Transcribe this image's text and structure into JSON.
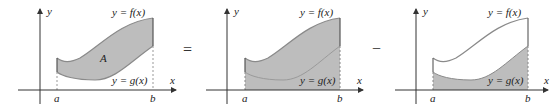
{
  "diagram": {
    "colors": {
      "region_fill": "#bdbdbd",
      "curve_stroke": "#8a8a8a",
      "axis": "#333333",
      "dashed": "#999999"
    },
    "operators": {
      "equals": "=",
      "minus": "−"
    },
    "panels": [
      {
        "name": "region-between-curves",
        "y_axis_label": "y",
        "x_axis_label": "x",
        "f_label": "y = f(x)",
        "g_label": "y = g(x)",
        "area_label": "A",
        "a_label": "a",
        "b_label": "b"
      },
      {
        "name": "area-under-f",
        "y_axis_label": "y",
        "x_axis_label": "x",
        "f_label": "y = f(x)",
        "g_label": "y = g(x)",
        "a_label": "a",
        "b_label": "b"
      },
      {
        "name": "area-under-g",
        "y_axis_label": "y",
        "x_axis_label": "x",
        "f_label": "y = f(x)",
        "g_label": "y = g(x)",
        "a_label": "a",
        "b_label": "b"
      }
    ]
  }
}
